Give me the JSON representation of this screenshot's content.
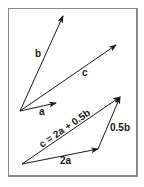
{
  "diagram": {
    "colors": {
      "frame": "#8a8a8a",
      "stroke": "#1a1a1a",
      "background": "#ffffff"
    },
    "top_group": {
      "vectors": [
        {
          "name": "b",
          "label": "b",
          "from": [
            20,
            111
          ],
          "to": [
            63,
            16
          ]
        },
        {
          "name": "c",
          "label": "c",
          "from": [
            20,
            111
          ],
          "to": [
            116,
            45
          ]
        },
        {
          "name": "a",
          "label": "a",
          "from": [
            20,
            111
          ],
          "to": [
            56,
            103
          ]
        }
      ]
    },
    "bottom_group": {
      "vectors": [
        {
          "name": "2a",
          "label": "2a",
          "from": [
            22,
            164
          ],
          "to": [
            98,
            149
          ]
        },
        {
          "name": "0.5b",
          "label": "0.5b",
          "from": [
            98,
            149
          ],
          "to": [
            120,
            97
          ]
        },
        {
          "name": "c-sum",
          "label": "c = 2a + 0.5b",
          "from": [
            22,
            164
          ],
          "to": [
            120,
            97
          ]
        }
      ]
    },
    "labels": {
      "b": "b",
      "c": "c",
      "a": "a",
      "two_a": "2a",
      "half_b": "0.5b",
      "equation": "c = 2a + 0.5b"
    }
  }
}
